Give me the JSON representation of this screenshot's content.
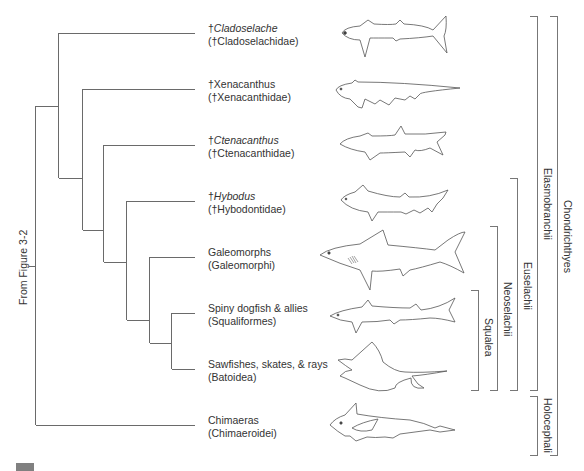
{
  "diagram": {
    "type": "cladogram",
    "root_label": "From Figure 3-2",
    "line_color": "#666666",
    "taxa": [
      {
        "prefix": "†",
        "name": "Cladoselache",
        "italic": true,
        "family": "(†Cladoselachidae)"
      },
      {
        "prefix": "†",
        "name": "Xenacanthus",
        "italic": false,
        "family": "(†Xenacanthidae)"
      },
      {
        "prefix": "†",
        "name": "Ctenacanthus",
        "italic": true,
        "family": "(†Ctenacanthidae)"
      },
      {
        "prefix": "†",
        "name": "Hybodus",
        "italic": true,
        "family": "(†Hybodontidae)"
      },
      {
        "prefix": "",
        "name": "Galeomorphs",
        "italic": false,
        "family": "(Galeomorphi)"
      },
      {
        "prefix": "",
        "name": "Spiny dogfish & allies",
        "italic": false,
        "family": "(Squaliformes)"
      },
      {
        "prefix": "",
        "name": "Sawfishes, skates, & rays",
        "italic": false,
        "family": "(Batoidea)"
      },
      {
        "prefix": "",
        "name": "Chimaeras",
        "italic": false,
        "family": "(Chimaeroidei)"
      }
    ],
    "clade_brackets": [
      {
        "label": "Squalea",
        "spans": [
          "Spiny dogfish & allies",
          "Sawfishes, skates, & rays"
        ]
      },
      {
        "label": "Neoselachii",
        "spans": [
          "Galeomorphs",
          "Sawfishes, skates, & rays"
        ]
      },
      {
        "label": "Euselachii",
        "spans": [
          "Hybodus",
          "Sawfishes, skates, & rays"
        ]
      },
      {
        "label": "Elasmobranchii",
        "spans": [
          "Cladoselache",
          "Sawfishes, skates, & rays"
        ]
      },
      {
        "label": "Holocephali",
        "spans": [
          "Chimaeras"
        ]
      },
      {
        "label": "Chondrichthyes",
        "spans": [
          "Cladoselache",
          "Chimaeras"
        ]
      }
    ],
    "illustrations": [
      "cladoselache-fish-icon",
      "xenacanthus-fish-icon",
      "ctenacanthus-fish-icon",
      "hybodus-fish-icon",
      "galeomorph-shark-icon",
      "spiny-dogfish-icon",
      "ray-icon",
      "chimaera-icon"
    ]
  }
}
